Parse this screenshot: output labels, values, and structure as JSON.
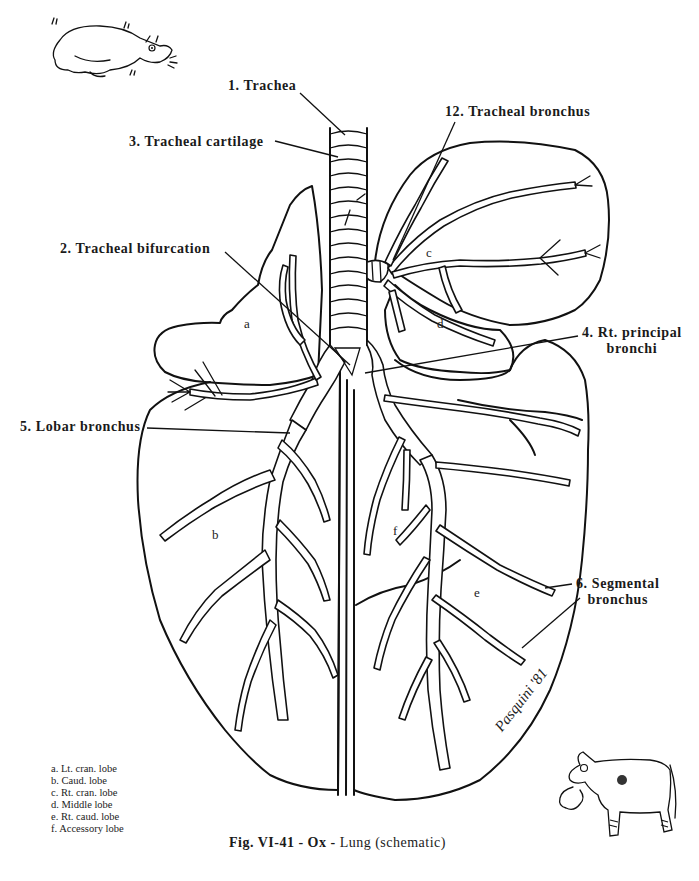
{
  "figure": {
    "caption_prefix": "Fig. VI-41 - Ox -",
    "caption_suffix": " Lung (schematic)",
    "signature": "Pasquini '81"
  },
  "callouts": [
    {
      "id": 1,
      "text": "1. Trachea"
    },
    {
      "id": 3,
      "text": "3. Tracheal cartilage"
    },
    {
      "id": 2,
      "text": "2. Tracheal bifurcation"
    },
    {
      "id": 12,
      "text": "12. Tracheal bronchus"
    },
    {
      "id": 4,
      "line1": "4. Rt. principal",
      "line2": "bronchi"
    },
    {
      "id": 5,
      "text": "5. Lobar bronchus"
    },
    {
      "id": 6,
      "line1": "6. Segmental",
      "line2": "bronchus"
    }
  ],
  "lobe_letters": [
    "a",
    "b",
    "c",
    "d",
    "e",
    "f"
  ],
  "legend": [
    "a. Lt. cran. lobe",
    "b. Caud. lobe",
    "c. Rt. cran. lobe",
    "d. Middle lobe",
    "e. Rt. caud. lobe",
    "f. Accessory lobe"
  ],
  "illustrations": {
    "top_left": "cartoon-lying-ox",
    "bottom_right": "cartoon-coughing-horse"
  }
}
